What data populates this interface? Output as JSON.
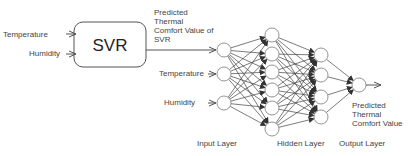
{
  "colors": {
    "stroke": "#555555",
    "node_stroke": "#888888",
    "text": "#444444"
  },
  "svr_block": {
    "label": "SVR",
    "inputs": [
      "Temperature",
      "Humidity"
    ],
    "output_label_lines": [
      "Predicted",
      "Thermal",
      "Comfort Value of",
      "SVR"
    ]
  },
  "ann": {
    "input_labels": [
      "Temperature",
      "Humidity"
    ],
    "layers": {
      "input": "Input Layer",
      "hidden": "Hidden Layer",
      "output": "Output Layer"
    },
    "layer_sizes": [
      3,
      6,
      4,
      1
    ],
    "output_label_lines": [
      "Predicted",
      "Thermal",
      "Comfort Value"
    ]
  }
}
